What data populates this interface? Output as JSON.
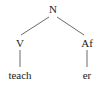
{
  "tree": {
    "root": {
      "label": "N"
    },
    "left": {
      "label": "V",
      "leaf": "teach"
    },
    "right": {
      "label": "Af",
      "leaf": "er"
    }
  },
  "colors": {
    "line": "#444444",
    "text": "#222222"
  }
}
